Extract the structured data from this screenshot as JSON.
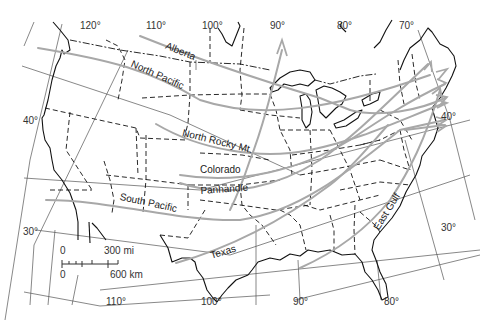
{
  "map": {
    "title": "Storm tracks across the United States",
    "track_color": "#a8a8a8",
    "tracks": [
      {
        "name": "Alberta"
      },
      {
        "name": "North Pacific"
      },
      {
        "name": "North Rocky Mt."
      },
      {
        "name": "Colorado"
      },
      {
        "name": "Panhandle"
      },
      {
        "name": "South Pacific"
      },
      {
        "name": "Texas"
      },
      {
        "name": "East Gulf"
      }
    ],
    "longitudes_top": [
      "120°",
      "110°",
      "100°",
      "90°",
      "80°",
      "70°"
    ],
    "longitudes_bottom": [
      "110°",
      "100°",
      "90°",
      "80°"
    ],
    "latitudes_left": [
      "40°",
      "30°"
    ],
    "latitudes_right": [
      "40°",
      "30°"
    ],
    "scale": {
      "zero_top": "0",
      "miles": "300 mi",
      "zero_bottom": "0",
      "km": "600 km"
    }
  }
}
